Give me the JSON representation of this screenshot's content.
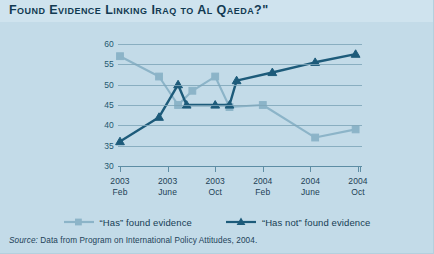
{
  "title": "Found Evidence Linking Iraq to Al Qaeda?\"",
  "source": {
    "prefix": "Source:",
    "text": " Data from Program on International Policy Attitudes, 2004."
  },
  "colors": {
    "background": "#c3dbe8",
    "title_band": "#cfe3ee",
    "title_text": "#123a52",
    "axis_text": "#1d3f55",
    "axis_title": "#2d7292",
    "gridline": "#7fa6b8",
    "series_has": "#8cb4c8",
    "series_has_not": "#1d5b7a"
  },
  "legend": {
    "position": "bottom",
    "items": [
      {
        "label": "“Has” found evidence",
        "marker": "square",
        "color": "#8cb4c8"
      },
      {
        "label": "“Has not” found evidence",
        "marker": "triangle",
        "color": "#1d5b7a"
      }
    ]
  },
  "chart_data": {
    "type": "line",
    "title": "Found Evidence Linking Iraq to Al Qaeda?\"",
    "xlabel": "",
    "ylabel": "Percentage of respondents",
    "ylim": [
      30,
      60
    ],
    "yticks": [
      30,
      35,
      40,
      45,
      50,
      55,
      60
    ],
    "grid": true,
    "categories": [
      "2003 Feb",
      "2003 June",
      "2003 Oct",
      "2004 Feb",
      "2004 June",
      "2004 Oct"
    ],
    "tick_labels": [
      {
        "year": "2003",
        "month": "Feb"
      },
      {
        "year": "2003",
        "month": "June"
      },
      {
        "year": "2003",
        "month": "Oct"
      },
      {
        "year": "2004",
        "month": "Feb"
      },
      {
        "year": "2004",
        "month": "June"
      },
      {
        "year": "2004",
        "month": "Oct"
      }
    ],
    "series": [
      {
        "name": "“Has” found evidence",
        "color": "#8cb4c8",
        "marker": "square",
        "points": [
          {
            "x": 0.0,
            "y": 57.0
          },
          {
            "x": 0.82,
            "y": 52.0
          },
          {
            "x": 1.22,
            "y": 45.0
          },
          {
            "x": 1.52,
            "y": 48.5
          },
          {
            "x": 2.0,
            "y": 52.0
          },
          {
            "x": 2.3,
            "y": 44.5
          },
          {
            "x": 3.0,
            "y": 45.0
          },
          {
            "x": 4.1,
            "y": 37.0
          },
          {
            "x": 4.95,
            "y": 39.0
          }
        ]
      },
      {
        "name": "“Has not” found evidence",
        "color": "#1d5b7a",
        "marker": "triangle",
        "points": [
          {
            "x": 0.0,
            "y": 36.0
          },
          {
            "x": 0.82,
            "y": 42.0
          },
          {
            "x": 1.22,
            "y": 50.0
          },
          {
            "x": 1.4,
            "y": 45.0
          },
          {
            "x": 2.0,
            "y": 45.0
          },
          {
            "x": 2.3,
            "y": 45.0
          },
          {
            "x": 2.45,
            "y": 51.0
          },
          {
            "x": 3.2,
            "y": 53.0
          },
          {
            "x": 4.1,
            "y": 55.5
          },
          {
            "x": 4.95,
            "y": 57.5
          }
        ]
      }
    ]
  }
}
